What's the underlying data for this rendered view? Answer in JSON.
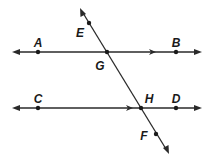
{
  "diagram": {
    "colors": {
      "line": "#2a2a2a",
      "point": "#1a1a1a",
      "background": "#ffffff"
    },
    "lines": [
      {
        "id": "AB",
        "name": "line-AB",
        "from": [
          13,
          52
        ],
        "to": [
          201,
          52
        ],
        "arrows": "both",
        "parallel_mark_x": 153
      },
      {
        "id": "CD",
        "name": "line-CD",
        "from": [
          13,
          108
        ],
        "to": [
          201,
          108
        ],
        "arrows": "both",
        "parallel_mark_x": 130
      },
      {
        "id": "EF",
        "name": "transversal-EF",
        "from": [
          81,
          9
        ],
        "to": [
          168,
          153
        ],
        "arrows": "both"
      }
    ],
    "points": [
      {
        "label": "A",
        "x": 38,
        "y": 52,
        "lx": 38,
        "ly": 47
      },
      {
        "label": "B",
        "x": 176,
        "y": 52,
        "lx": 176,
        "ly": 47
      },
      {
        "label": "G",
        "x": 107,
        "y": 52,
        "lx": 100,
        "ly": 70
      },
      {
        "label": "C",
        "x": 38,
        "y": 108,
        "lx": 38,
        "ly": 103
      },
      {
        "label": "D",
        "x": 176,
        "y": 108,
        "lx": 176,
        "ly": 103
      },
      {
        "label": "H",
        "x": 141,
        "y": 108,
        "lx": 149,
        "ly": 103
      },
      {
        "label": "E",
        "x": 89,
        "y": 23,
        "lx": 80,
        "ly": 37
      },
      {
        "label": "F",
        "x": 156,
        "y": 134,
        "lx": 144,
        "ly": 140
      }
    ],
    "labels": {
      "A": "A",
      "B": "B",
      "C": "C",
      "D": "D",
      "E": "E",
      "F": "F",
      "G": "G",
      "H": "H"
    }
  }
}
